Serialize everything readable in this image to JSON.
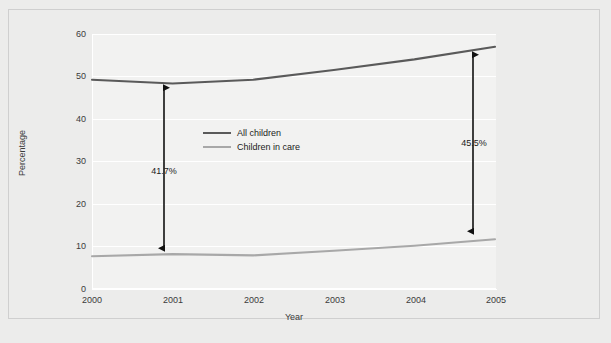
{
  "chart_data": {
    "type": "line",
    "title": "",
    "xlabel": "Year",
    "ylabel": "Percentage",
    "x": [
      2000,
      2001,
      2002,
      2003,
      2004,
      2005
    ],
    "categories": [
      "2000",
      "2001",
      "2002",
      "2003",
      "2004",
      "2005"
    ],
    "xlim": [
      2000,
      2005
    ],
    "ylim": [
      0,
      60
    ],
    "yticks": [
      0,
      10,
      20,
      30,
      40,
      50,
      60
    ],
    "ytick_labels": [
      "0",
      "10",
      "20",
      "30",
      "40",
      "50",
      "60"
    ],
    "grid": "horizontal",
    "legend_position": "center-left-inside",
    "series": [
      {
        "name": "All children",
        "color": "#5a5a5a",
        "values": [
          49.2,
          48.3,
          49.2,
          51.5,
          54.0,
          57.0
        ]
      },
      {
        "name": "Children in care",
        "color": "#a8a8a8",
        "values": [
          7.5,
          8.0,
          7.7,
          8.8,
          10.0,
          11.5
        ]
      }
    ],
    "annotations": [
      {
        "id": "gap-2000",
        "label": "41.7%",
        "at_x": 2000,
        "from_value": 7.5,
        "to_value": 49.2,
        "style": "double-headed-arrow"
      },
      {
        "id": "gap-2005",
        "label": "45.5%",
        "at_x": 2005,
        "from_value": 11.5,
        "to_value": 57.0,
        "style": "double-headed-arrow"
      }
    ]
  },
  "axes": {
    "y_title": "Percentage",
    "x_title": "Year",
    "y_ticks": [
      "60",
      "50",
      "40",
      "30",
      "20",
      "10",
      "0"
    ],
    "x_ticks": [
      "2000",
      "2001",
      "2002",
      "2003",
      "2004",
      "2005"
    ]
  },
  "legend": {
    "items": [
      {
        "label": "All children",
        "color": "#5a5a5a"
      },
      {
        "label": "Children in care",
        "color": "#a8a8a8"
      }
    ]
  },
  "annotations": {
    "left": {
      "label": "41.7%"
    },
    "right": {
      "label": "45.5%"
    }
  },
  "colors": {
    "page_background": "#ececeb",
    "plot_background": "#f2f2f1",
    "gridline": "#ffffff",
    "frame_border": "#cfcfcf",
    "series_all_children": "#5a5a5a",
    "series_children_in_care": "#a8a8a8",
    "annotation_arrow": "#111111",
    "tick_text": "#3b3b3b"
  }
}
